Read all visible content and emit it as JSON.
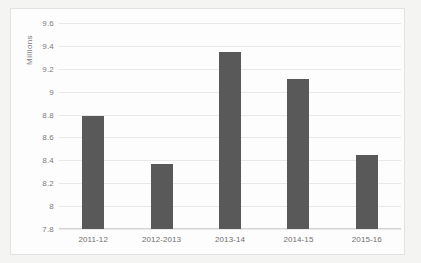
{
  "chart_data": {
    "type": "bar",
    "title": "",
    "xlabel": "",
    "ylabel": "Millions",
    "categories": [
      "2011-12",
      "2012-2013",
      "2013-14",
      "2014-15",
      "2015-16"
    ],
    "values": [
      8.79,
      8.37,
      9.35,
      9.11,
      8.45
    ],
    "ylim": [
      7.8,
      9.6
    ],
    "yticks": [
      "7.8",
      "8",
      "8.2",
      "8.4",
      "8.6",
      "8.8",
      "9",
      "9.2",
      "9.4",
      "9.6"
    ],
    "ytick_values": [
      7.8,
      8,
      8.2,
      8.4,
      8.6,
      8.8,
      9,
      9.2,
      9.4,
      9.6
    ],
    "grid": true,
    "legend": false,
    "legend_position": "none",
    "bar_color": "#595959",
    "gridline_color": "#e8e8e8",
    "axis_text_color": "#7b7b7b",
    "plot_background": "#fdfdfd",
    "frame_border_color": "#e2e2e2"
  }
}
